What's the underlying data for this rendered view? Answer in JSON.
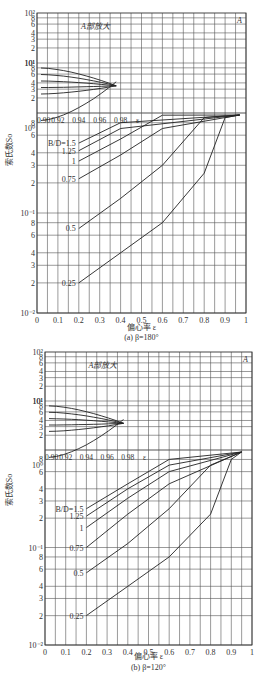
{
  "chart_data": [
    {
      "type": "line",
      "title": "(a) β=180°",
      "xlabel": "偏心率 ε",
      "ylabel": "索氏数So",
      "yscale": "log",
      "xlim": [
        0,
        1
      ],
      "ylim": [
        0.01,
        1
      ],
      "x_ticks": [
        "0",
        "0.1",
        "0.2",
        "0.3",
        "0.4",
        "0.5",
        "0.6",
        "0.7",
        "0.8",
        "0.9",
        "1"
      ],
      "y_ticks": [
        "10⁻²",
        "2",
        "3",
        "4",
        "6",
        "8",
        "10⁻¹",
        "2",
        "3",
        "4",
        "6",
        "8",
        "10⁰"
      ],
      "inset": {
        "label": "A部放大",
        "x_ticks": [
          "0.90",
          "0.92",
          "0.94",
          "0.96",
          "0.98",
          "ε"
        ],
        "y_ticks": [
          "2",
          "3",
          "4",
          "6",
          "8",
          "10¹",
          "2",
          "3",
          "4",
          "6",
          "8",
          "10²"
        ],
        "ylim": [
          1,
          100
        ]
      },
      "annotation": "A",
      "legend_label": "B/D",
      "series": [
        {
          "name": "B/D=1.5",
          "x": [
            0.2,
            0.4,
            0.6,
            0.8,
            0.9,
            0.97
          ],
          "y": [
            0.5,
            0.8,
            1.3,
            3,
            7,
            40
          ]
        },
        {
          "name": "1.25",
          "x": [
            0.2,
            0.4,
            0.6,
            0.8,
            0.9,
            0.97
          ],
          "y": [
            0.42,
            0.7,
            1.15,
            2.7,
            6.5,
            38
          ]
        },
        {
          "name": "1",
          "x": [
            0.2,
            0.4,
            0.6,
            0.8,
            0.9,
            0.97
          ],
          "y": [
            0.33,
            0.55,
            0.95,
            2.3,
            5.7,
            35
          ]
        },
        {
          "name": "0.75",
          "x": [
            0.2,
            0.4,
            0.6,
            0.8,
            0.9,
            0.97
          ],
          "y": [
            0.22,
            0.38,
            0.7,
            1.8,
            4.8,
            30
          ]
        },
        {
          "name": "0.5",
          "x": [
            0.2,
            0.4,
            0.6,
            0.8,
            0.9,
            0.97
          ],
          "y": [
            0.07,
            0.14,
            0.3,
            0.9,
            2.8,
            20
          ]
        },
        {
          "name": "0.25",
          "x": [
            0.2,
            0.4,
            0.6,
            0.8,
            0.9,
            0.97
          ],
          "y": [
            0.02,
            0.04,
            0.08,
            0.25,
            0.9,
            8
          ]
        }
      ]
    },
    {
      "type": "line",
      "title": "(b) β=120°",
      "xlabel": "偏心率 ε",
      "ylabel": "索氏数So",
      "yscale": "log",
      "xlim": [
        0,
        1
      ],
      "ylim": [
        0.01,
        1
      ],
      "x_ticks": [
        "0",
        "0.1",
        "0.2",
        "0.3",
        "0.4",
        "0.5",
        "0.6",
        "0.7",
        "0.8",
        "0.9",
        "1"
      ],
      "y_ticks": [
        "10⁻²",
        "2",
        "3",
        "4",
        "6",
        "8",
        "10⁻¹",
        "2",
        "3",
        "4",
        "6",
        "8",
        "10⁰"
      ],
      "inset": {
        "label": "A部放大",
        "x_ticks": [
          "0.90",
          "0.92",
          "0.94",
          "0.96",
          "0.98",
          "ε"
        ],
        "y_ticks": [
          "2",
          "3",
          "4",
          "6",
          "8",
          "10¹",
          "2",
          "3",
          "4",
          "6",
          "8",
          "10²"
        ],
        "ylim": [
          1,
          100
        ]
      },
      "annotation": "A",
      "legend_label": "B/D",
      "series": [
        {
          "name": "B/D=1.5",
          "x": [
            0.2,
            0.4,
            0.6,
            0.8,
            0.9,
            0.95
          ],
          "y": [
            0.25,
            0.45,
            0.8,
            1.8,
            4.5,
            30
          ]
        },
        {
          "name": "1.25",
          "x": [
            0.2,
            0.4,
            0.6,
            0.8,
            0.9,
            0.95
          ],
          "y": [
            0.21,
            0.4,
            0.7,
            1.6,
            4.2,
            28
          ]
        },
        {
          "name": "1",
          "x": [
            0.2,
            0.4,
            0.6,
            0.8,
            0.9,
            0.95
          ],
          "y": [
            0.16,
            0.32,
            0.6,
            1.4,
            3.8,
            26
          ]
        },
        {
          "name": "0.75",
          "x": [
            0.2,
            0.4,
            0.6,
            0.8,
            0.9,
            0.95
          ],
          "y": [
            0.1,
            0.22,
            0.45,
            1.1,
            3.2,
            22
          ]
        },
        {
          "name": "0.5",
          "x": [
            0.2,
            0.4,
            0.6,
            0.8,
            0.9,
            0.95
          ],
          "y": [
            0.055,
            0.11,
            0.25,
            0.7,
            2.2,
            16
          ]
        },
        {
          "name": "0.25",
          "x": [
            0.2,
            0.4,
            0.6,
            0.8,
            0.9,
            0.95
          ],
          "y": [
            0.02,
            0.04,
            0.08,
            0.22,
            0.8,
            6
          ]
        }
      ]
    }
  ]
}
